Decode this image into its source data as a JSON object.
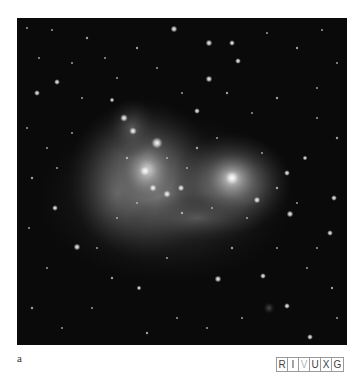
{
  "figure": {
    "panel_label": "a",
    "image_description": "Grayscale astronomical photograph of a star-forming region: diffuse glowing nebula with two bright clusters amid a dense star field",
    "wavelength_bands": [
      {
        "letter": "R",
        "highlighted": false
      },
      {
        "letter": "I",
        "highlighted": false
      },
      {
        "letter": "V",
        "highlighted": true
      },
      {
        "letter": "U",
        "highlighted": false
      },
      {
        "letter": "X",
        "highlighted": false
      },
      {
        "letter": "G",
        "highlighted": false
      }
    ]
  }
}
